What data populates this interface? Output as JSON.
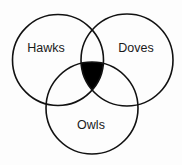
{
  "diagram": {
    "type": "venn",
    "sets": [
      {
        "id": "hawks",
        "label": "Hawks",
        "cx": 58,
        "cy": 60,
        "r": 45.5
      },
      {
        "id": "doves",
        "label": "Doves",
        "cx": 127,
        "cy": 60,
        "r": 46
      },
      {
        "id": "owls",
        "label": "Owls",
        "cx": 92,
        "cy": 108,
        "r": 46
      }
    ],
    "shaded_region": {
      "description": "Intersection of Hawks, Doves and Owls",
      "sets": [
        "hawks",
        "doves",
        "owls"
      ],
      "color": "#000000"
    },
    "stroke_color": "#111111",
    "background": "#fdfdfd"
  }
}
